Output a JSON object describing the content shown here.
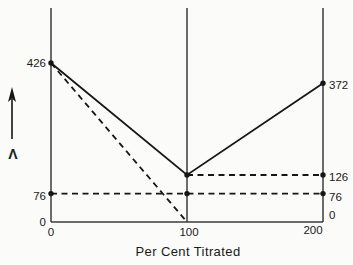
{
  "page": {
    "background": "#fbfbf9",
    "ink_color": "#161616",
    "axis_color": "#3c3c3c"
  },
  "chart_data": {
    "type": "line",
    "title": "",
    "xlabel": "Per Cent Titrated",
    "ylabel": "Λ",
    "xlim": [
      0,
      200
    ],
    "ylim": [
      0,
      570
    ],
    "x_ticks": [
      0,
      100,
      200
    ],
    "grid": "vertical lines at each x tick, baseline at y=0, no horizontal gridlines",
    "legend": "none",
    "series": [
      {
        "name": "conductance-titration-curve",
        "style": "solid",
        "points": [
          [
            0,
            426
          ],
          [
            100,
            126
          ],
          [
            200,
            372
          ]
        ]
      },
      {
        "name": "extrapolation-diagonal",
        "style": "dashed",
        "points": [
          [
            0,
            426
          ],
          [
            100,
            0
          ]
        ]
      },
      {
        "name": "reference-line-76",
        "style": "dashed",
        "points": [
          [
            0,
            76
          ],
          [
            200,
            76
          ]
        ]
      },
      {
        "name": "reference-line-126",
        "style": "dashed",
        "points": [
          [
            100,
            126
          ],
          [
            200,
            126
          ]
        ]
      }
    ],
    "markers": [
      [
        0,
        426
      ],
      [
        0,
        76
      ],
      [
        100,
        126
      ],
      [
        100,
        76
      ],
      [
        200,
        372
      ],
      [
        200,
        126
      ],
      [
        200,
        76
      ]
    ],
    "left_axis_labels": [
      {
        "text": "426",
        "value": 426
      },
      {
        "text": "76",
        "value": 76,
        "dy": 2
      },
      {
        "text": "0",
        "value": 0
      }
    ],
    "right_axis_labels": [
      {
        "text": "372",
        "value": 372,
        "dy": 2
      },
      {
        "text": "126",
        "value": 126,
        "dy": 2
      },
      {
        "text": "76",
        "value": 76,
        "dy": 3
      },
      {
        "text": "0",
        "value": 0,
        "dy": -7
      }
    ],
    "bottom_axis_labels": [
      {
        "text": "0",
        "value": 0
      },
      {
        "text": "100",
        "value": 100,
        "dx": 2
      },
      {
        "text": "200",
        "value": 200,
        "dx": -10,
        "dy": -2
      }
    ]
  }
}
